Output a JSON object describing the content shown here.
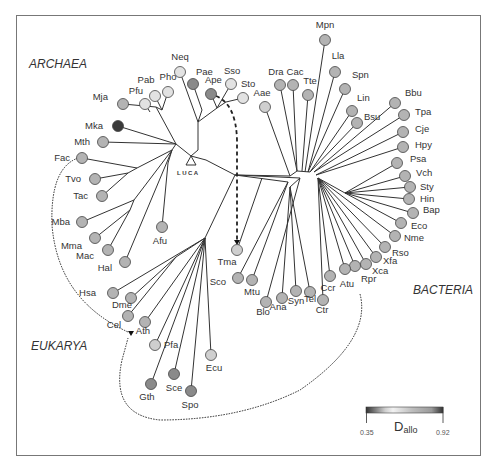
{
  "domains": {
    "archaea": "ARCHAEA",
    "bacteria": "BACTERIA",
    "eukarya": "EUKARYA"
  },
  "root_label": "LUCA",
  "legend": {
    "title_main": "D",
    "title_sub": "allo",
    "min": "0.35",
    "max": "0.92"
  },
  "colors": {
    "light": "#e2e2e2",
    "medium_light": "#cfcfcf",
    "medium": "#b3b3b3",
    "dark": "#8a8a8a",
    "darkest": "#3a3a3a"
  },
  "nodes": [
    {
      "id": "Neq",
      "tone": "light"
    },
    {
      "id": "Pae",
      "tone": "dark"
    },
    {
      "id": "Ape",
      "tone": "dark"
    },
    {
      "id": "Sso",
      "tone": "light"
    },
    {
      "id": "Sto",
      "tone": "light"
    },
    {
      "id": "Pab",
      "tone": "light"
    },
    {
      "id": "Pho",
      "tone": "light"
    },
    {
      "id": "Pfu",
      "tone": "light"
    },
    {
      "id": "Mja",
      "tone": "medium"
    },
    {
      "id": "Mka",
      "tone": "darkest"
    },
    {
      "id": "Mth",
      "tone": "medium"
    },
    {
      "id": "Fac",
      "tone": "medium"
    },
    {
      "id": "Tvo",
      "tone": "medium"
    },
    {
      "id": "Tac",
      "tone": "medium"
    },
    {
      "id": "Mba",
      "tone": "medium"
    },
    {
      "id": "Mma",
      "tone": "medium"
    },
    {
      "id": "Mac",
      "tone": "medium"
    },
    {
      "id": "Hal",
      "tone": "medium"
    },
    {
      "id": "Afu",
      "tone": "medium"
    },
    {
      "id": "Aae",
      "tone": "medium_light"
    },
    {
      "id": "Dra",
      "tone": "medium"
    },
    {
      "id": "Cac",
      "tone": "medium"
    },
    {
      "id": "Tte",
      "tone": "medium"
    },
    {
      "id": "Mpn",
      "tone": "medium"
    },
    {
      "id": "Lla",
      "tone": "medium"
    },
    {
      "id": "Spn",
      "tone": "medium"
    },
    {
      "id": "Lin",
      "tone": "medium"
    },
    {
      "id": "Bsu",
      "tone": "medium"
    },
    {
      "id": "Bbu",
      "tone": "medium"
    },
    {
      "id": "Tpa",
      "tone": "medium"
    },
    {
      "id": "Cje",
      "tone": "medium"
    },
    {
      "id": "Hpy",
      "tone": "medium"
    },
    {
      "id": "Psa",
      "tone": "medium"
    },
    {
      "id": "Vch",
      "tone": "medium"
    },
    {
      "id": "Sty",
      "tone": "medium"
    },
    {
      "id": "Hin",
      "tone": "medium"
    },
    {
      "id": "Bap",
      "tone": "medium"
    },
    {
      "id": "Eco",
      "tone": "medium"
    },
    {
      "id": "Nme",
      "tone": "medium"
    },
    {
      "id": "Rso",
      "tone": "medium"
    },
    {
      "id": "Xfa",
      "tone": "medium"
    },
    {
      "id": "Xca",
      "tone": "medium"
    },
    {
      "id": "Rpr",
      "tone": "medium"
    },
    {
      "id": "Atu",
      "tone": "medium"
    },
    {
      "id": "Ccr",
      "tone": "medium"
    },
    {
      "id": "Ctr",
      "tone": "medium"
    },
    {
      "id": "Tel",
      "tone": "medium"
    },
    {
      "id": "Syn",
      "tone": "medium"
    },
    {
      "id": "Ana",
      "tone": "medium"
    },
    {
      "id": "Blo",
      "tone": "medium"
    },
    {
      "id": "Mtu",
      "tone": "medium"
    },
    {
      "id": "Sco",
      "tone": "medium"
    },
    {
      "id": "Tma",
      "tone": "medium_light"
    },
    {
      "id": "Hsa",
      "tone": "medium"
    },
    {
      "id": "Dme",
      "tone": "medium"
    },
    {
      "id": "Cel",
      "tone": "medium"
    },
    {
      "id": "Ath",
      "tone": "medium"
    },
    {
      "id": "Pfa",
      "tone": "medium_light"
    },
    {
      "id": "Gth",
      "tone": "dark"
    },
    {
      "id": "Sce",
      "tone": "dark"
    },
    {
      "id": "Spo",
      "tone": "dark"
    },
    {
      "id": "Ecu",
      "tone": "medium_light"
    }
  ]
}
